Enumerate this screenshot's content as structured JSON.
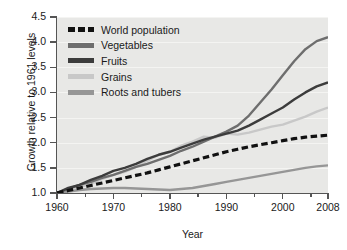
{
  "chart_data": {
    "type": "line",
    "title": "",
    "xlabel": "Year",
    "ylabel": "Growth relative to 1961 levels",
    "xlim": [
      1960,
      2008
    ],
    "ylim": [
      1.0,
      4.5
    ],
    "xticks": [
      1960,
      1970,
      1980,
      1990,
      2000,
      2008
    ],
    "yticks": [
      1.0,
      1.5,
      2.0,
      2.5,
      3.0,
      3.5,
      4.0,
      4.5
    ],
    "grid": true,
    "legend_position": "top-left",
    "x": [
      1960,
      1962,
      1964,
      1966,
      1968,
      1970,
      1972,
      1974,
      1976,
      1978,
      1980,
      1982,
      1984,
      1986,
      1988,
      1990,
      1992,
      1994,
      1996,
      1998,
      2000,
      2002,
      2004,
      2006,
      2008
    ],
    "series": [
      {
        "name": "World population",
        "color": "#111111",
        "style": "dashed",
        "values": [
          1.0,
          1.05,
          1.1,
          1.15,
          1.2,
          1.25,
          1.3,
          1.35,
          1.4,
          1.46,
          1.52,
          1.58,
          1.64,
          1.7,
          1.76,
          1.82,
          1.87,
          1.92,
          1.96,
          2.0,
          2.04,
          2.08,
          2.11,
          2.13,
          2.15
        ]
      },
      {
        "name": "Vegetables",
        "color": "#6e6e6e",
        "style": "solid",
        "values": [
          1.0,
          1.08,
          1.16,
          1.22,
          1.3,
          1.36,
          1.44,
          1.52,
          1.58,
          1.66,
          1.74,
          1.84,
          1.92,
          2.02,
          2.12,
          2.22,
          2.34,
          2.54,
          2.8,
          3.06,
          3.34,
          3.62,
          3.86,
          4.02,
          4.1
        ]
      },
      {
        "name": "Fruits",
        "color": "#3c3c3c",
        "style": "solid",
        "values": [
          1.0,
          1.1,
          1.16,
          1.26,
          1.34,
          1.44,
          1.5,
          1.58,
          1.68,
          1.76,
          1.82,
          1.9,
          1.98,
          2.06,
          2.12,
          2.18,
          2.24,
          2.34,
          2.46,
          2.58,
          2.7,
          2.86,
          3.0,
          3.12,
          3.2
        ]
      },
      {
        "name": "Grains",
        "color": "#c8c8c8",
        "style": "solid",
        "values": [
          1.0,
          1.06,
          1.12,
          1.18,
          1.28,
          1.36,
          1.42,
          1.52,
          1.64,
          1.76,
          1.82,
          1.94,
          2.02,
          2.12,
          2.1,
          2.18,
          2.16,
          2.2,
          2.26,
          2.32,
          2.36,
          2.44,
          2.52,
          2.62,
          2.7
        ]
      },
      {
        "name": "Roots and tubers",
        "color": "#969696",
        "style": "solid",
        "values": [
          1.0,
          1.03,
          1.06,
          1.08,
          1.09,
          1.1,
          1.1,
          1.09,
          1.08,
          1.07,
          1.06,
          1.08,
          1.1,
          1.14,
          1.18,
          1.22,
          1.26,
          1.3,
          1.34,
          1.38,
          1.42,
          1.46,
          1.5,
          1.53,
          1.55
        ]
      }
    ]
  },
  "legend": {
    "items": [
      {
        "label": "World population"
      },
      {
        "label": "Vegetables"
      },
      {
        "label": "Fruits"
      },
      {
        "label": "Grains"
      },
      {
        "label": "Roots and tubers"
      }
    ]
  },
  "axes": {
    "y_tick_labels": [
      "1.0",
      "1.5",
      "2.0",
      "2.5",
      "3.0",
      "3.5",
      "4.0",
      "4.5"
    ],
    "x_tick_labels": [
      "1960",
      "1970",
      "1980",
      "1990",
      "2000",
      "2008"
    ]
  }
}
